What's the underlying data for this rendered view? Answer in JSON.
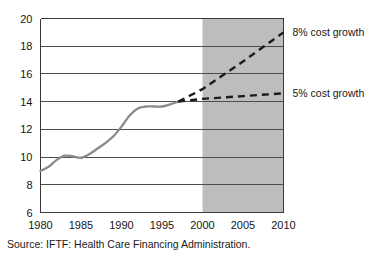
{
  "source_note": "Source: IFTF: Health Care Financing Administration.",
  "chart_data": {
    "type": "line",
    "title": "",
    "xlabel": "",
    "ylabel": "",
    "xlim": [
      1980,
      2010
    ],
    "ylim": [
      6,
      20
    ],
    "grid": true,
    "x_ticks": [
      1980,
      1985,
      1990,
      1995,
      2000,
      2005,
      2010
    ],
    "y_ticks": [
      6,
      8,
      10,
      12,
      14,
      16,
      18,
      20
    ],
    "forecast_band": {
      "label": "2000",
      "start": 2000,
      "end": 2010,
      "color": "#bdbdbd"
    },
    "legend_position": "right",
    "series": [
      {
        "name": "historical",
        "style": "solid",
        "color": "#8a8a8a",
        "label": "",
        "x": [
          1980,
          1981,
          1982,
          1983,
          1984,
          1985,
          1986,
          1987,
          1988,
          1989,
          1990,
          1991,
          1992,
          1993,
          1994,
          1995,
          1996,
          1997
        ],
        "values": [
          9.0,
          9.3,
          9.8,
          10.1,
          10.05,
          9.95,
          10.2,
          10.6,
          11.0,
          11.5,
          12.2,
          13.0,
          13.5,
          13.65,
          13.65,
          13.65,
          13.8,
          14.0
        ]
      },
      {
        "name": "5% cost growth",
        "style": "dashed",
        "color": "#1c1c1c",
        "label": "5% cost growth",
        "x": [
          1997,
          2000,
          2005,
          2010
        ],
        "values": [
          14.0,
          14.2,
          14.4,
          14.6
        ]
      },
      {
        "name": "8% cost growth",
        "style": "dashed",
        "color": "#1c1c1c",
        "label": "8% cost growth",
        "x": [
          1997,
          2000,
          2005,
          2010
        ],
        "values": [
          14.0,
          14.9,
          16.9,
          19.0
        ]
      }
    ],
    "annotations": [
      {
        "text": "8% cost growth",
        "x": 2010,
        "y": 19.0
      },
      {
        "text": "5% cost growth",
        "x": 2010,
        "y": 14.6
      }
    ]
  }
}
